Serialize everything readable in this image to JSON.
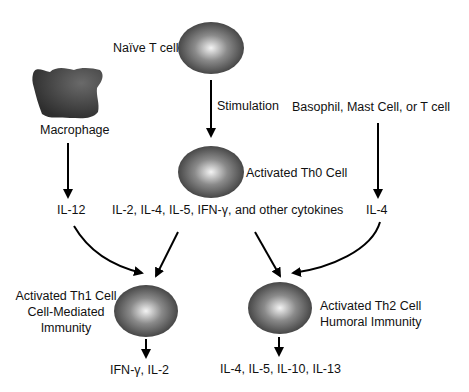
{
  "diagram": {
    "nodes": {
      "naive_t_cell": "Naïve T cell",
      "stimulation": "Stimulation",
      "macrophage": "Macrophage",
      "basophil": "Basophil, Mast Cell, or T cell",
      "th0": "Activated Th0 Cell",
      "il12": "IL-12",
      "th0_cytokines": "IL-2, IL-4, IL-5, IFN-γ, and other cytokines",
      "il4": "IL-4",
      "th1_title": "Activated Th1 Cell",
      "th1_line2": "Cell-Mediated",
      "th1_line3": "Immunity",
      "th2_title": "Activated Th2 Cell",
      "th2_line2": "Humoral Immunity",
      "th1_output": "IFN-γ, IL-2",
      "th2_output": "IL-4, IL-5, IL-10, IL-13"
    },
    "colors": {
      "cell_highlight": "#f2f2f2",
      "cell_shadow": "#3a3a3a",
      "macrophage": "#3c3c3c",
      "arrow": "#000000"
    }
  }
}
